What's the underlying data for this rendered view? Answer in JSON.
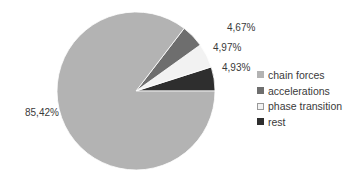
{
  "chart_data": {
    "type": "pie",
    "title": "",
    "categories": [
      "chain forces",
      "accelerations",
      "phase transition",
      "rest"
    ],
    "values": [
      85.42,
      4.67,
      4.97,
      4.93
    ],
    "labels": [
      "85,42%",
      "4,67%",
      "4,97%",
      "4,93%"
    ],
    "colors": [
      "#b3b3b3",
      "#6e6e6e",
      "#f2f2f2",
      "#2e2e2e"
    ],
    "legend_position": "right",
    "start_angle_deg": 0,
    "direction": "counterclockwise"
  },
  "legend": {
    "items": [
      {
        "label": "chain forces",
        "color": "#b3b3b3"
      },
      {
        "label": "accelerations",
        "color": "#6e6e6e"
      },
      {
        "label": "phase transition",
        "color": "#f2f2f2"
      },
      {
        "label": "rest",
        "color": "#2e2e2e"
      }
    ]
  },
  "data_labels": {
    "chain_forces": "85,42%",
    "accelerations": "4,67%",
    "phase_transition": "4,97%",
    "rest": "4,93%"
  }
}
